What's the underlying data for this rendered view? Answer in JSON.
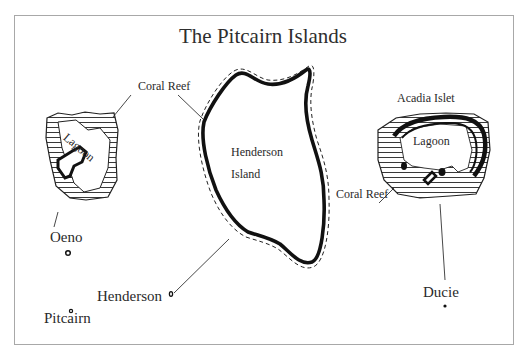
{
  "map": {
    "title": "The Pitcairn Islands",
    "labels": {
      "coral_reef_top": "Coral Reef",
      "coral_reef_right": "Coral Reef",
      "oeno_lagoon": "Lagoon",
      "ducie_lagoon": "Lagoon",
      "acadia_islet": "Acadia Islet",
      "henderson_island_line1": "Henderson",
      "henderson_island_line2": "Island"
    },
    "locator": {
      "oeno": "Oeno",
      "henderson": "Henderson",
      "pitcairn": "Pitcairn",
      "ducie": "Ducie"
    },
    "colors": {
      "ink": "#111111",
      "frame": "#a8a8a8",
      "background": "#ffffff"
    }
  }
}
